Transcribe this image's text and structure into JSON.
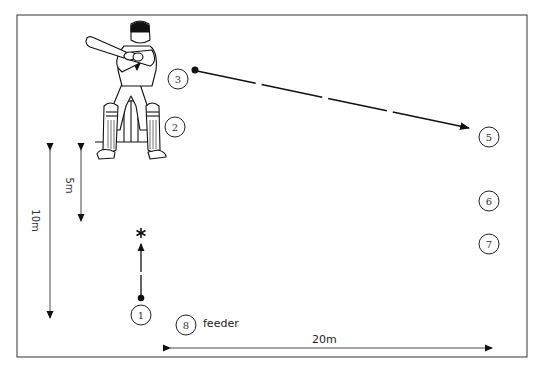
{
  "diagram": {
    "colors": {
      "line": "#1a1a1a",
      "border": "#555555",
      "background": "#ffffff"
    },
    "positions": [
      {
        "id": "1",
        "label": "1",
        "x": 141,
        "y": 315
      },
      {
        "id": "2",
        "label": "2",
        "x": 175,
        "y": 127
      },
      {
        "id": "3",
        "label": "3",
        "x": 178,
        "y": 79
      },
      {
        "id": "5",
        "label": "5",
        "x": 489,
        "y": 137
      },
      {
        "id": "6",
        "label": "6",
        "x": 489,
        "y": 201
      },
      {
        "id": "7",
        "label": "7",
        "x": 489,
        "y": 244
      },
      {
        "id": "8",
        "label": "8",
        "x": 186,
        "y": 324
      }
    ],
    "feeder_label": "feeder",
    "dimensions": {
      "ten_m": "10m",
      "five_m": "5m",
      "twenty_m": "20m"
    },
    "figures": {
      "batsman": "batsman-at-wicket",
      "target_marker": "asterisk"
    }
  }
}
